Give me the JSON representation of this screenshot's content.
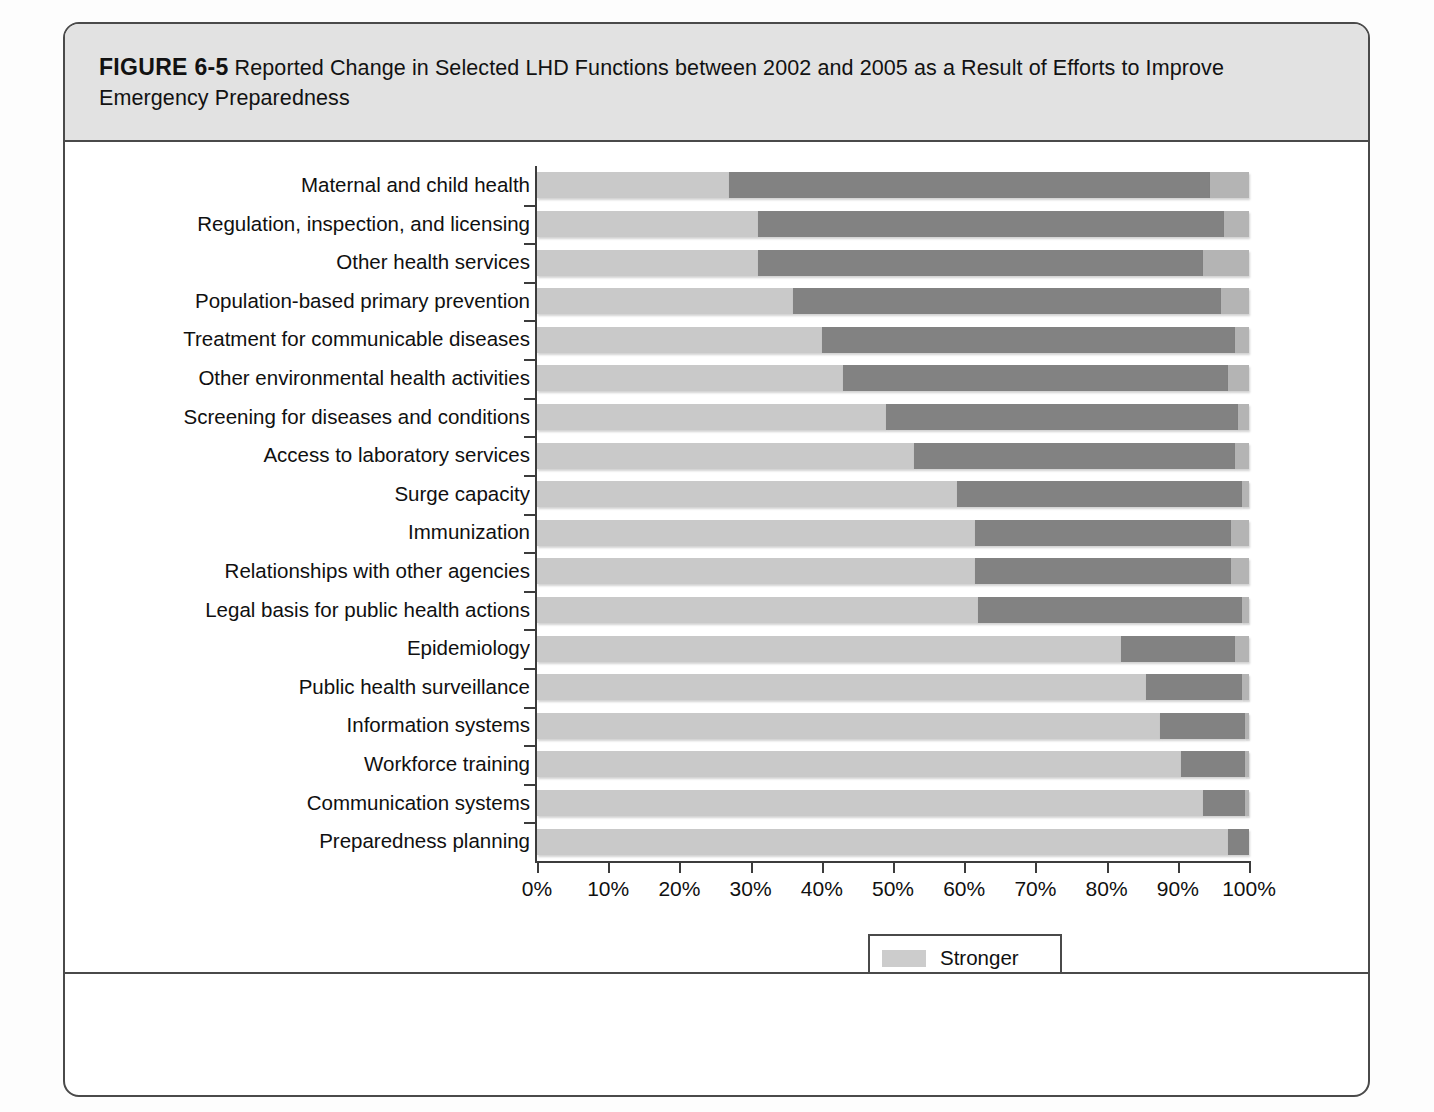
{
  "figure": {
    "label": "FIGURE 6-5",
    "caption": "Reported Change in Selected LHD Functions between 2002 and 2005 as a Result of Efforts to Improve Emergency Preparedness"
  },
  "chart_data": {
    "type": "bar",
    "title": "Reported Change in Selected LHD Functions between 2002 and 2005 as a Result of Efforts to Improve Emergency Preparedness",
    "orientation": "horizontal",
    "stacked": true,
    "stack_mode": "percent",
    "xlabel": "",
    "ylabel": "",
    "xlim": [
      0,
      100
    ],
    "xtick_labels": [
      "0%",
      "10%",
      "20%",
      "30%",
      "40%",
      "50%",
      "60%",
      "70%",
      "80%",
      "90%",
      "100%"
    ],
    "xticks": [
      0,
      10,
      20,
      30,
      40,
      50,
      60,
      70,
      80,
      90,
      100
    ],
    "grid": false,
    "legend_position": "bottom-center",
    "categories": [
      "Maternal and child health",
      "Regulation, inspection, and licensing",
      "Other health services",
      "Population-based primary prevention",
      "Treatment for communicable diseases",
      "Other environmental health activities",
      "Screening for diseases and conditions",
      "Access to laboratory services",
      "Surge capacity",
      "Immunization",
      "Relationships with other agencies",
      "Legal basis for public health actions",
      "Epidemiology",
      "Public health surveillance",
      "Information systems",
      "Workforce training",
      "Communication systems",
      "Preparedness planning"
    ],
    "series": [
      {
        "name": "Stronger",
        "color": "#c9c9c9",
        "values": [
          27,
          31,
          31,
          36,
          40,
          43,
          49,
          53,
          59,
          61.5,
          61.5,
          62,
          82,
          85.5,
          87.5,
          90.5,
          93.5,
          97
        ]
      },
      {
        "name": "No Change",
        "color": "#828282",
        "values": [
          67.5,
          65.5,
          62.5,
          60,
          58,
          54,
          49.5,
          45,
          40,
          36,
          36,
          37,
          16,
          13.5,
          12,
          9,
          6,
          3
        ]
      },
      {
        "name": "Weaker",
        "color": "#b4b4b4",
        "values": [
          5.5,
          3.5,
          6.5,
          4,
          2,
          3,
          1.5,
          2,
          1,
          2.5,
          2.5,
          1,
          2,
          1,
          0.5,
          0.5,
          0.5,
          0
        ]
      }
    ],
    "legend": [
      {
        "label": "Stronger",
        "color": "#c9c9c9"
      },
      {
        "label": "No Change",
        "color": "#828282"
      },
      {
        "label": "Weaker",
        "color": "#b4b4b4"
      }
    ]
  }
}
